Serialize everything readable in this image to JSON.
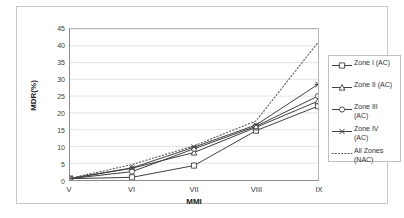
{
  "chart_data": {
    "type": "line",
    "title": "",
    "xlabel": "MMI",
    "ylabel": "MDR(%)",
    "categories": [
      "V",
      "VI",
      "VII",
      "VIII",
      "IX"
    ],
    "ylim": [
      0,
      45
    ],
    "ytick_step": 5,
    "yticks": [
      45,
      40,
      35,
      30,
      25,
      20,
      15,
      10,
      5,
      0
    ],
    "grid": true,
    "grid_axis": "y",
    "legend_position": "right",
    "series": [
      {
        "name": "Zone I (AC)",
        "marker": "square",
        "linestyle": "solid",
        "color": "#404040",
        "values": [
          0.4,
          0.8,
          4.3,
          14.7,
          22.0
        ]
      },
      {
        "name": "Zone II (AC)",
        "marker": "triangle",
        "linestyle": "solid",
        "color": "#404040",
        "values": [
          0.4,
          3.5,
          8.2,
          15.7,
          23.5
        ]
      },
      {
        "name": "Zone III (AC)",
        "marker": "circle",
        "linestyle": "solid",
        "color": "#404040",
        "values": [
          0.4,
          2.5,
          9.3,
          16.0,
          25.0
        ]
      },
      {
        "name": "Zone IV (AC)",
        "marker": "x",
        "linestyle": "solid",
        "color": "#404040",
        "values": [
          0.5,
          3.6,
          9.8,
          16.4,
          28.5
        ]
      },
      {
        "name": "All Zones (NAC)",
        "marker": "none",
        "linestyle": "dotted",
        "color": "#595959",
        "values": [
          0.5,
          4.6,
          10.2,
          17.6,
          41.0
        ]
      }
    ]
  },
  "legend": {
    "items": [
      {
        "label": "Zone I (AC)"
      },
      {
        "label": "Zone II (AC)"
      },
      {
        "label": "Zone III\n(AC)"
      },
      {
        "label": "Zone IV\n(AC)"
      },
      {
        "label": "All Zones\n(NAC)"
      }
    ]
  }
}
